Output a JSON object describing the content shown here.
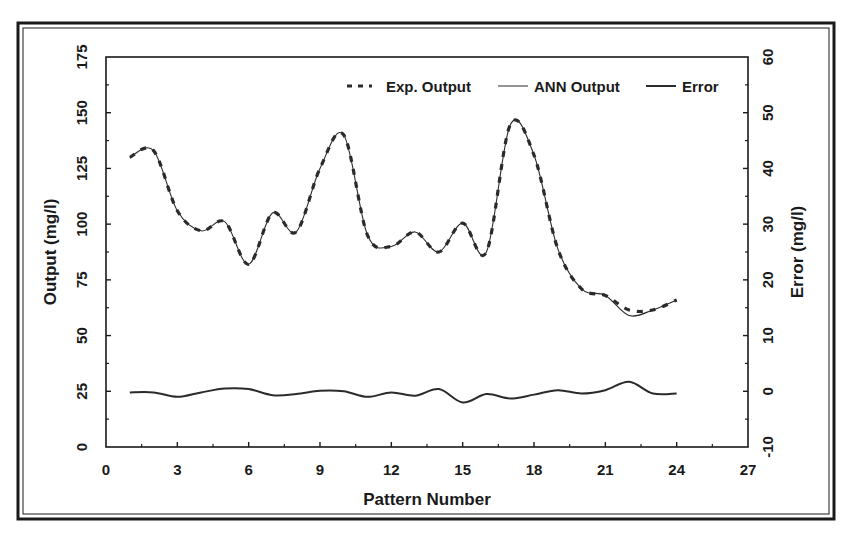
{
  "chart_data": {
    "type": "line",
    "title": "",
    "xlabel": "Pattern Number",
    "ylabel": "Output (mg/l)",
    "y2label": "Error (mg/l)",
    "xlim": [
      0,
      27
    ],
    "ylim": [
      0,
      175
    ],
    "y2lim": [
      -10,
      60
    ],
    "xticks": [
      0,
      3,
      6,
      9,
      12,
      15,
      18,
      21,
      24,
      27
    ],
    "yticks": [
      0,
      25,
      50,
      75,
      100,
      125,
      150,
      175
    ],
    "y2ticks": [
      -10,
      0,
      10,
      20,
      30,
      40,
      50,
      60
    ],
    "grid": false,
    "legend_position": "top-right inside",
    "x": [
      1,
      2,
      3,
      4,
      5,
      6,
      7,
      8,
      9,
      10,
      11,
      12,
      13,
      14,
      15,
      16,
      17,
      18,
      19,
      20,
      21,
      22,
      23,
      24
    ],
    "series": [
      {
        "name": "Exp. Output",
        "axis": "left",
        "style": "dashed",
        "values": [
          130,
          133,
          106,
          97,
          101,
          82,
          105,
          96.5,
          125,
          140,
          95,
          90,
          96.5,
          87.5,
          100.5,
          87.5,
          144.5,
          131,
          89,
          71,
          68,
          61.5,
          61.5,
          66
        ]
      },
      {
        "name": "ANN Output",
        "axis": "left",
        "style": "thin-solid",
        "values": [
          130,
          133,
          106,
          97,
          101,
          82,
          105,
          96.5,
          125,
          140,
          95,
          90,
          96.5,
          87.5,
          100.5,
          87.5,
          144.5,
          131,
          89,
          71,
          68,
          59,
          61.5,
          66
        ]
      },
      {
        "name": "Error",
        "axis": "right",
        "style": "solid",
        "values": [
          -0.2,
          -0.2,
          -1,
          -0.2,
          0.5,
          0.4,
          -0.7,
          -0.5,
          0.1,
          0,
          -1,
          -0.2,
          -0.8,
          0.4,
          -2,
          -0.5,
          -1.3,
          -0.6,
          0.2,
          -0.4,
          0.2,
          1.7,
          -0.4,
          -0.4
        ]
      }
    ]
  },
  "legend": {
    "items": [
      {
        "label": "Exp. Output",
        "style": "dashed"
      },
      {
        "label": "ANN Output",
        "style": "thin-solid"
      },
      {
        "label": "Error",
        "style": "solid"
      }
    ]
  },
  "colors": {
    "line": "#2b2b2b",
    "frame": "#1a1a1a",
    "background": "#ffffff"
  }
}
